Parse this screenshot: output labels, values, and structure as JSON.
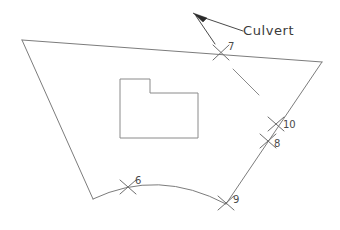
{
  "drawing": {
    "title": "Parcel boundary sketch with culvert annotation",
    "background_color": "#ffffff",
    "line_color": "#7c7c7c",
    "label_color": "#4a4a4a",
    "annotation_color": "#3a3a3a",
    "width": 340,
    "height": 230
  },
  "annotation": {
    "culvert_label": "Culvert",
    "leader_dash": "—",
    "arrow_icon": "arrow-up-left"
  },
  "markers": [
    {
      "id": "6",
      "label": "6",
      "x": 128,
      "y": 187,
      "label_x": 135,
      "label_y": 184,
      "on": "bottom-arc"
    },
    {
      "id": "7",
      "label": "7",
      "x": 221,
      "y": 52,
      "label_x": 228,
      "label_y": 50,
      "on": "top-edge"
    },
    {
      "id": "8",
      "label": "8",
      "x": 268,
      "y": 141,
      "label_x": 275,
      "label_y": 147,
      "on": "right-edge"
    },
    {
      "id": "9",
      "label": "9",
      "x": 226,
      "y": 203,
      "label_x": 233,
      "label_y": 203,
      "on": "bottom-right-vertex"
    },
    {
      "id": "10",
      "label": "10",
      "x": 276,
      "y": 124,
      "label_x": 283,
      "label_y": 128,
      "on": "right-edge"
    }
  ],
  "geometry": {
    "parcel_vertices": [
      {
        "name": "top-left",
        "x": 22,
        "y": 40
      },
      {
        "name": "top-right",
        "x": 322,
        "y": 62
      },
      {
        "name": "bottom-right",
        "x": 226,
        "y": 204
      },
      {
        "name": "bottom-left",
        "x": 93,
        "y": 199
      }
    ],
    "bottom_arc": {
      "from_x": 93,
      "from_y": 199,
      "ctrl_x": 158,
      "ctrl_y": 168,
      "to_x": 226,
      "to_y": 204
    },
    "building_outline": "L-shaped footprint",
    "building_points": "120,79 150,79 150,93 198,93 198,138 120,138"
  }
}
